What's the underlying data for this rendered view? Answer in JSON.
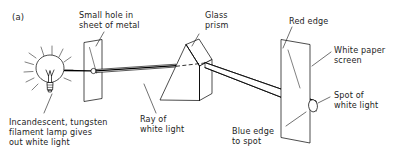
{
  "figure": {
    "panel_id": "(a)",
    "background_color": "#ffffff",
    "ink_color": "#000000"
  },
  "labels": {
    "panel": "(a)",
    "small_hole": "Small hole in\nsheet of metal",
    "glass_prism": "Glass\nprism",
    "red_edge": "Red edge",
    "white_paper_screen": "White paper\nscreen",
    "spot_of_white_light": "Spot of\nwhite light",
    "blue_edge_to_spot": "Blue edge\nto spot",
    "ray_of_white_light": "Ray of\nwhite light",
    "lamp_caption": "Incandescent, tungsten\nfilament lamp gives\nout white light"
  },
  "components": {
    "lamp": {
      "name": "incandescent-tungsten-filament-lamp",
      "emits": "white light",
      "ray_count": 10
    },
    "metal_sheet": {
      "name": "sheet-of-metal-with-small-hole",
      "aperture": "small hole"
    },
    "prism": {
      "name": "glass-prism",
      "shape": "triangular"
    },
    "screen": {
      "name": "white-paper-screen",
      "shows": "spot of white light"
    },
    "beam_incident": {
      "name": "ray-of-white-light",
      "color": "white"
    },
    "beam_refracted": {
      "name": "dispersed-beam",
      "upper_edge": "Red edge",
      "lower_edge": "Blue edge"
    }
  }
}
